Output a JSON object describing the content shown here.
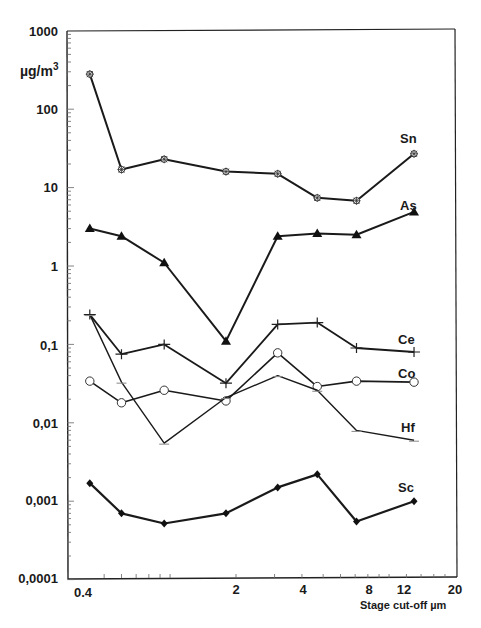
{
  "chart_data": {
    "type": "line",
    "title": "",
    "xlabel": "Stage cut-off µm",
    "ylabel": "µg/m3",
    "xscale": "log",
    "yscale": "log",
    "xlim": [
      0.4,
      20
    ],
    "ylim": [
      0.0001,
      1000
    ],
    "x_ticks": [
      "0.4",
      "2",
      "4",
      "8",
      "12",
      "20"
    ],
    "y_ticks": [
      "1000",
      "100",
      "10",
      "1",
      "0,1",
      "0,01",
      "0,001",
      "0,0001"
    ],
    "grid": false,
    "legend": "inline labels at right end of each series",
    "x": [
      0.43,
      0.6,
      0.94,
      1.8,
      3.1,
      4.7,
      7.1,
      13
    ],
    "series": [
      {
        "name": "Sn",
        "marker": "star",
        "values": [
          280,
          17,
          23,
          16,
          15,
          7.4,
          6.8,
          27
        ]
      },
      {
        "name": "As",
        "marker": "filled-triangle",
        "values": [
          3.0,
          2.4,
          1.1,
          0.11,
          2.4,
          2.6,
          2.5,
          4.9
        ]
      },
      {
        "name": "Ce",
        "marker": "plus",
        "values": [
          0.24,
          0.075,
          0.1,
          0.032,
          0.18,
          0.19,
          0.09,
          0.08
        ]
      },
      {
        "name": "Co",
        "marker": "open-circle",
        "values": [
          0.034,
          0.018,
          0.026,
          0.019,
          0.078,
          0.029,
          0.034,
          0.033
        ]
      },
      {
        "name": "Hf",
        "marker": "dash",
        "values": [
          0.24,
          0.033,
          0.0055,
          0.021,
          0.04,
          0.026,
          0.008,
          0.006
        ]
      },
      {
        "name": "Sc",
        "marker": "filled-diamond",
        "values": [
          0.0017,
          0.0007,
          0.00052,
          0.0007,
          0.0015,
          0.0022,
          0.00055,
          0.001
        ]
      }
    ]
  },
  "labels": {
    "unit": "µg/m",
    "unit_sup": "3",
    "x_title": "Stage cut-off µm",
    "y_ticks": [
      "1000",
      "100",
      "10",
      "1",
      "0,1",
      "0,01",
      "0,001",
      "0,0001"
    ],
    "x_ticks": [
      "0.4",
      "2",
      "4",
      "8",
      "12",
      "20"
    ],
    "series": [
      "Sn",
      "As",
      "Ce",
      "Co",
      "Hf",
      "Sc"
    ]
  }
}
